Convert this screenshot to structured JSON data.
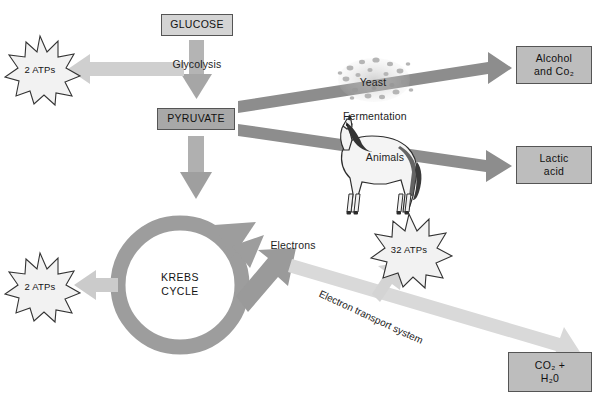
{
  "figure": {
    "title_cut_off": "",
    "background": "#ffffff"
  },
  "palette": {
    "box_light": "#d4d4d4",
    "box_mid": "#bdbdbd",
    "box_dark": "#a8a8a8",
    "box_border": "#555555",
    "arrow_dark": "#8c8c8c",
    "arrow_mid": "#9a9a9a",
    "arrow_light": "#d2d2d2",
    "arrow_pale": "#dcdcdc",
    "burst_fill": "#f2f2f2",
    "burst_stroke": "#3a3a3a",
    "text": "#1a1a1a"
  },
  "boxes": [
    {
      "name": "glucose",
      "label": "GLUCOSE",
      "x": 161,
      "y": 14,
      "w": 72,
      "h": 22,
      "tone": "light"
    },
    {
      "name": "pyruvate",
      "label": "PYRUVATE",
      "x": 157,
      "y": 108,
      "w": 78,
      "h": 22,
      "tone": "dark"
    },
    {
      "name": "alcohol-co2",
      "label": "Alcohol\nand Co₂",
      "x": 516,
      "y": 46,
      "w": 76,
      "h": 38,
      "tone": "mid"
    },
    {
      "name": "lactic-acid",
      "label": "Lactic\nacid",
      "x": 516,
      "y": 146,
      "w": 76,
      "h": 38,
      "tone": "mid"
    },
    {
      "name": "co2-h2o",
      "label": "CO₂ +\nH₂0",
      "x": 508,
      "y": 352,
      "w": 84,
      "h": 40,
      "tone": "mid"
    }
  ],
  "bursts": [
    {
      "name": "atps-glycolysis",
      "label": "2 ATPs",
      "cx": 40,
      "cy": 68,
      "r": 32
    },
    {
      "name": "atps-krebs",
      "label": "2 ATPs",
      "cx": 40,
      "cy": 285,
      "r": 32
    },
    {
      "name": "atps-ets",
      "label": "32 ATPs",
      "cx": 409,
      "cy": 248,
      "r": 34
    }
  ],
  "labels": [
    {
      "name": "glycolysis-label",
      "text": "Glycolysis",
      "x": 197,
      "y": 64,
      "align": "center"
    },
    {
      "name": "yeast-label",
      "text": "Yeast",
      "x": 373,
      "y": 82,
      "align": "center"
    },
    {
      "name": "fermentation-label",
      "text": "Fermentation",
      "x": 343,
      "y": 116,
      "align": "left"
    },
    {
      "name": "animals-label",
      "text": "Animals",
      "x": 385,
      "y": 157,
      "align": "center"
    },
    {
      "name": "electrons-label",
      "text": "Electrons",
      "x": 293,
      "y": 245,
      "align": "center"
    },
    {
      "name": "krebs-cycle-label",
      "text": "KREBS\nCYCLE",
      "x": 180,
      "y": 285,
      "align": "center"
    },
    {
      "name": "ets-label",
      "text": "Electron transport system",
      "x": 327,
      "y": 296,
      "rotation": 25
    }
  ],
  "illustration": {
    "name": "horse-illustration",
    "caption": "Animals",
    "cx": 372,
    "cy": 170
  },
  "yeast_cluster": {
    "name": "yeast-cells-illustration",
    "cx": 374,
    "cy": 80
  }
}
